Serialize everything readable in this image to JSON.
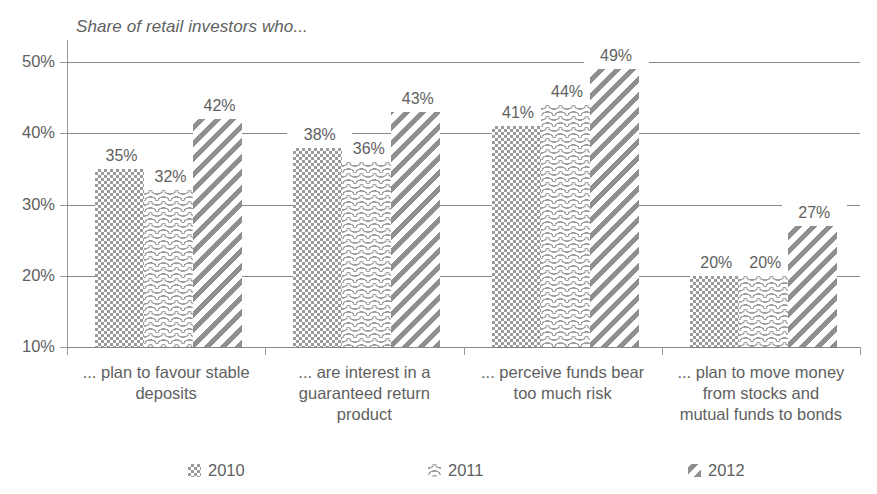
{
  "chart_data": {
    "type": "bar",
    "title": "Share of retail investors who...",
    "xlabel": "",
    "ylabel": "",
    "ylim": [
      10,
      50
    ],
    "ytick_labels": [
      "10%",
      "20%",
      "30%",
      "40%",
      "50%"
    ],
    "ytick_values": [
      10,
      20,
      30,
      40,
      50
    ],
    "grid": true,
    "legend_position": "bottom",
    "value_suffix": "%",
    "categories": [
      "... plan to favour stable deposits",
      "... are interest in a guaranteed return product",
      "... perceive funds bear too much risk",
      "... plan to move money from stocks and mutual funds to bonds"
    ],
    "category_lines": [
      [
        "... plan to favour stable",
        "deposits"
      ],
      [
        "... are interest in a",
        "guaranteed return",
        "product"
      ],
      [
        "... perceive funds bear",
        "too much risk"
      ],
      [
        "... plan to move money",
        "from stocks and",
        "mutual funds to bonds"
      ]
    ],
    "series": [
      {
        "name": "2010",
        "pattern": "checkerboard",
        "values": [
          35,
          38,
          41,
          20
        ],
        "labels": [
          "35%",
          "38%",
          "41%",
          "20%"
        ]
      },
      {
        "name": "2011",
        "pattern": "wavy-horizontal",
        "values": [
          32,
          36,
          44,
          20
        ],
        "labels": [
          "32%",
          "36%",
          "44%",
          "20%"
        ]
      },
      {
        "name": "2012",
        "pattern": "diagonal-stripes",
        "values": [
          42,
          43,
          49,
          27
        ],
        "labels": [
          "42%",
          "43%",
          "49%",
          "27%"
        ]
      }
    ],
    "colors": {
      "pattern_ink": "#9b9b9b",
      "axis": "#868686",
      "text": "#5f5f5f",
      "background": "#ffffff"
    }
  },
  "legend": {
    "items": [
      {
        "label": "2010",
        "swatch": "swatch-2010-icon"
      },
      {
        "label": "2011",
        "swatch": "swatch-2011-icon"
      },
      {
        "label": "2012",
        "swatch": "swatch-2012-icon"
      }
    ]
  }
}
